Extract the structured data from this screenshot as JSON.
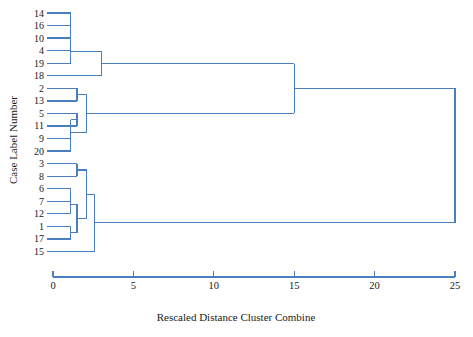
{
  "chart_data": {
    "type": "dendrogram",
    "title": "",
    "xlabel": "Rescaled Distance Cluster Combine",
    "ylabel": "Case Label Number",
    "xlim": [
      0,
      25
    ],
    "xticks": [
      0,
      5,
      10,
      15,
      20,
      25
    ],
    "xtick_labels": [
      "0",
      "5",
      "10",
      "15",
      "20",
      "25"
    ],
    "grid": false,
    "legend": null,
    "line_color": "#4A7EBC",
    "leaf_order": [
      14,
      16,
      10,
      4,
      19,
      18,
      2,
      13,
      5,
      11,
      9,
      20,
      3,
      8,
      6,
      7,
      12,
      1,
      17,
      15
    ],
    "leaf_labels": [
      "14",
      "16",
      "10",
      "4",
      "19",
      "18",
      "2",
      "13",
      "5",
      "11",
      "9",
      "20",
      "3",
      "8",
      "6",
      "7",
      "12",
      "1",
      "17",
      "15"
    ],
    "n_leaves": 20,
    "merges": [
      {
        "id": "m1",
        "left": "leaf:14",
        "right": "leaf:16",
        "distance": 1.1
      },
      {
        "id": "m2",
        "left": "m1",
        "right": "leaf:10",
        "distance": 1.1
      },
      {
        "id": "m3",
        "left": "m2",
        "right": "leaf:4",
        "distance": 1.1
      },
      {
        "id": "m4",
        "left": "m3",
        "right": "leaf:19",
        "distance": 1.1
      },
      {
        "id": "m5",
        "left": "m4",
        "right": "leaf:18",
        "distance": 3.0
      },
      {
        "id": "m6",
        "left": "leaf:2",
        "right": "leaf:13",
        "distance": 1.5
      },
      {
        "id": "m7",
        "left": "leaf:5",
        "right": "leaf:11",
        "distance": 1.5
      },
      {
        "id": "m8",
        "left": "leaf:9",
        "right": "leaf:20",
        "distance": 1.1
      },
      {
        "id": "m9",
        "left": "m7",
        "right": "m8",
        "distance": 1.1
      },
      {
        "id": "m10",
        "left": "m6",
        "right": "m9",
        "distance": 2.1
      },
      {
        "id": "m11",
        "left": "m5",
        "right": "m10",
        "distance": 15.0
      },
      {
        "id": "m12",
        "left": "leaf:3",
        "right": "leaf:8",
        "distance": 1.5
      },
      {
        "id": "m13",
        "left": "leaf:6",
        "right": "leaf:7",
        "distance": 1.1
      },
      {
        "id": "m14",
        "left": "m13",
        "right": "leaf:12",
        "distance": 1.1
      },
      {
        "id": "m15",
        "left": "leaf:1",
        "right": "leaf:17",
        "distance": 1.1
      },
      {
        "id": "m16",
        "left": "m14",
        "right": "m15",
        "distance": 1.5
      },
      {
        "id": "m17",
        "left": "m12",
        "right": "m16",
        "distance": 2.1
      },
      {
        "id": "m18",
        "left": "m17",
        "right": "leaf:15",
        "distance": 2.6
      },
      {
        "id": "m19",
        "left": "m11",
        "right": "m18",
        "distance": 25.0
      }
    ],
    "root": "m19"
  },
  "geometry": {
    "plot_left": 53,
    "plot_right": 455,
    "first_row_y": 13,
    "row_step": 12.55,
    "axis_y": 277,
    "tick_len": 6,
    "leaf_stub": 5
  }
}
